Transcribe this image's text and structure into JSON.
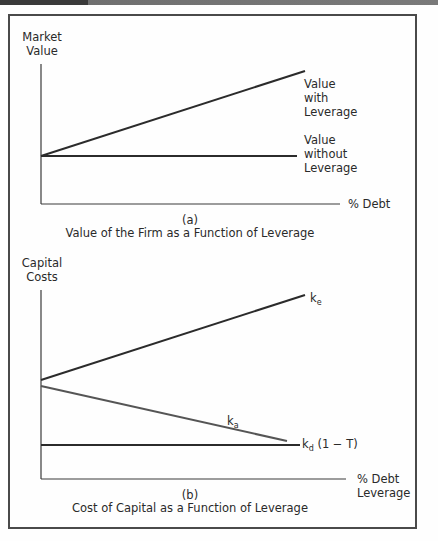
{
  "figures": [
    {
      "id": "a",
      "y_axis_label_line1": "Market",
      "y_axis_label_line2": "Value",
      "x_axis_label": "% Debt",
      "panel_letter": "(a)",
      "caption": "Value of the Firm as a Function of Leverage",
      "lines": [
        {
          "name": "value-with-leverage",
          "label_lines": [
            "Value",
            "with",
            "Leverage"
          ],
          "trend": "increasing"
        },
        {
          "name": "value-without-leverage",
          "label_lines": [
            "Value",
            "without",
            "Leverage"
          ],
          "trend": "flat"
        }
      ]
    },
    {
      "id": "b",
      "y_axis_label_line1": "Capital",
      "y_axis_label_line2": "Costs",
      "x_axis_label_line1": "% Debt",
      "x_axis_label_line2": "Leverage",
      "panel_letter": "(b)",
      "caption": "Cost of Capital as a Function of Leverage",
      "lines": [
        {
          "name": "k-e",
          "symbol": "k",
          "subscript": "e",
          "suffix": "",
          "trend": "increasing"
        },
        {
          "name": "k-a",
          "symbol": "k",
          "subscript": "a",
          "suffix": "",
          "trend": "decreasing"
        },
        {
          "name": "k-d-after-tax",
          "symbol": "k",
          "subscript": "d",
          "suffix": " (1 − T)",
          "trend": "flat"
        }
      ]
    }
  ],
  "colors": {
    "line_dark": "#2b2b2b",
    "line_gray": "#555555",
    "frame": "#4a4a4a"
  }
}
